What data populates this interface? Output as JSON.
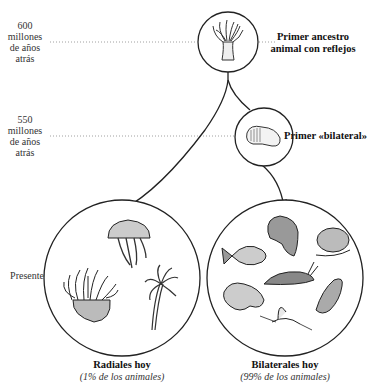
{
  "timeline": {
    "t600": {
      "l1": "600",
      "l2": "millones",
      "l3": "de años",
      "l4": "atrás"
    },
    "t550": {
      "l1": "550",
      "l2": "millones",
      "l3": "de años",
      "l4": "atrás"
    },
    "present": "Presente"
  },
  "nodes": {
    "ancestor": {
      "line1": "Primer ancestro",
      "line2": "animal con reflejos",
      "icon": "sea-anemone-polyp-icon"
    },
    "bilateral": {
      "label": "Primer «bilateral»",
      "icon": "worm-icon"
    }
  },
  "groups": {
    "radial": {
      "title": "Radiales hoy",
      "subtitle": "(1% de los animales)",
      "animals": [
        "jellyfish",
        "sea-anemone",
        "hydra"
      ]
    },
    "bilateral": {
      "title": "Bilaterales hoy",
      "subtitle": "(99% de los animales)",
      "animals": [
        "monkey",
        "fish",
        "hamster",
        "slug",
        "frog",
        "bird",
        "mayfly"
      ]
    }
  },
  "colors": {
    "ink": "#222222",
    "dotted": "#888888",
    "background": "#ffffff"
  }
}
